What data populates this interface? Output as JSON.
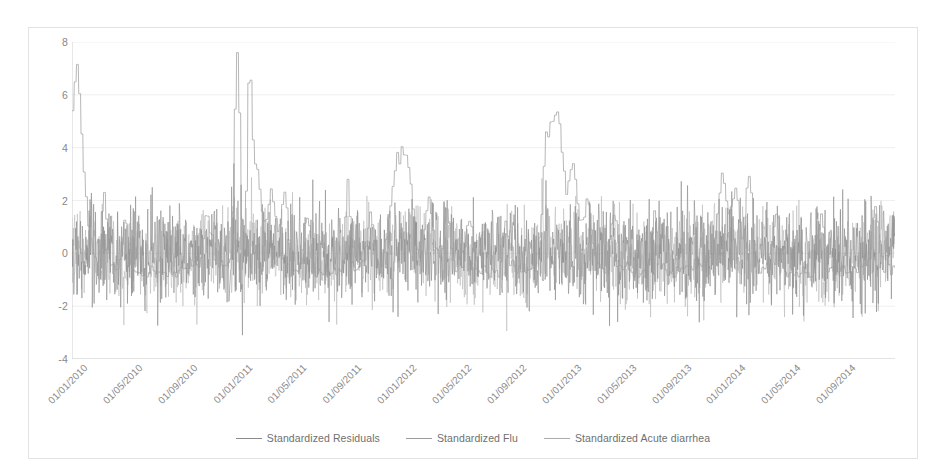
{
  "chart_data": {
    "type": "line",
    "title": "",
    "subtitle": "",
    "xlabel": "",
    "ylabel": "",
    "ylim": [
      -4,
      8
    ],
    "yticks": [
      8,
      6,
      4,
      2,
      0,
      -2,
      -4
    ],
    "ytick_labels": [
      "8",
      "6",
      "4",
      "2",
      "0",
      "-2",
      "-4"
    ],
    "grid": true,
    "grid_axis": "y",
    "legend_position": "bottom",
    "x_axis_type": "date",
    "x_start": "01/01/2010",
    "x_end": "31/12/2014",
    "xtick_labels": [
      "01/01/2010",
      "01/05/2010",
      "01/09/2010",
      "01/01/2011",
      "01/05/2011",
      "01/09/2011",
      "01/01/2012",
      "01/05/2012",
      "01/09/2012",
      "01/01/2013",
      "01/05/2013",
      "01/09/2013",
      "01/01/2014",
      "01/05/2014",
      "01/09/2014"
    ],
    "series": [
      {
        "name": "Standardized Residuals",
        "color": "#8c8c8c",
        "kind": "noise",
        "description": "High frequency daily standardized residuals oscillating about 0, mostly between -2 and +2, with occasional excursions to -3.8 and +3.3",
        "mean": 0,
        "sd": 0.95,
        "min": -3.8,
        "max": 3.4
      },
      {
        "name": "Standardized Flu",
        "color": "#a0a0a0",
        "kind": "seasonal-step",
        "description": "Seasonal winter flu peaks; baseline near -0.6 in summer with sharp winter peaks",
        "min": -0.9,
        "max": 7.6,
        "peaks": [
          {
            "label": "01/01/2010",
            "value": 5.05
          },
          {
            "label": "02/2010",
            "value": 3.3
          },
          {
            "label": "01/2011",
            "value": 7.6
          },
          {
            "label": "02/2011",
            "value": 5.8
          },
          {
            "label": "01/2012",
            "value": 3.3
          },
          {
            "label": "01/2013",
            "value": 5.05
          },
          {
            "label": "01/2014",
            "value": 2.7
          }
        ]
      },
      {
        "name": "Standardized Acute diarrhea",
        "color": "#b0b0b0",
        "kind": "noise",
        "description": "Standardized acute diarrhea counts, noisy around 0 with winter excursions up to ~3",
        "mean": 0,
        "sd": 0.85,
        "min": -3.0,
        "max": 3.2
      }
    ]
  },
  "legend": {
    "items": [
      {
        "label": "Standardized Residuals",
        "color": "#8c8c8c"
      },
      {
        "label": "Standardized Flu",
        "color": "#9c9c9c"
      },
      {
        "label": "Standardized Acute diarrhea",
        "color": "#ababab"
      }
    ]
  },
  "axes": {
    "y_label_color": "#878787",
    "x_label_color": "#8a8a8a",
    "grid_color": "#efefef",
    "axis_color": "#cfcfcf",
    "frame_color": "#e3e3e3"
  }
}
